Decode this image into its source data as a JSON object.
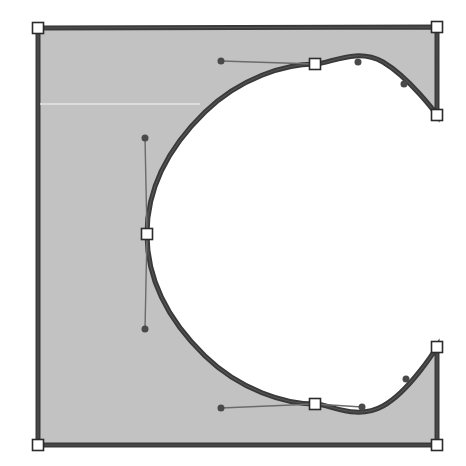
{
  "app": {
    "title": "Glyph Outline Editor",
    "view_name": "glyph-outline-view",
    "canvas_width": 466,
    "canvas_height": 466,
    "background_color": "#ffffff"
  },
  "glyph": {
    "character": "C",
    "name": "latin-capital-letter-c",
    "fill_color": "#c2c2c2",
    "outline_color": "#3a3a3a",
    "outline_width": 5,
    "inner_outline_color": "#55555a",
    "scanline_color": "#e4e4e4",
    "scanline_y": 104,
    "path": "M 38 28 L 437 27 L 437 115 C 437 115 410 78 383 62 C 356 47 330 64 315 64 C 285 64 240 78 205 112 C 170 146 147 185 147 234 C 147 283 170 322 205 356 C 240 390 285 404 315 404 C 330 404 356 421 383 406 C 410 391 437 347 437 347 L 437 445 L 38 445 Z"
  },
  "nodes": [
    {
      "id": "n1",
      "type": "corner",
      "label": "top-left-corner-node",
      "x": 38,
      "y": 28,
      "selected": true
    },
    {
      "id": "n2",
      "type": "corner",
      "label": "top-right-corner-node",
      "x": 437,
      "y": 27,
      "selected": true
    },
    {
      "id": "n3",
      "type": "corner",
      "label": "upper-terminal-node",
      "x": 437,
      "y": 115,
      "selected": true
    },
    {
      "id": "n4",
      "type": "curve",
      "label": "top-arc-node",
      "x": 315,
      "y": 64,
      "selected": true
    },
    {
      "id": "n5",
      "type": "curve",
      "label": "left-arc-node",
      "x": 147,
      "y": 234,
      "selected": true
    },
    {
      "id": "n6",
      "type": "curve",
      "label": "bottom-arc-node",
      "x": 315,
      "y": 404,
      "selected": true
    },
    {
      "id": "n7",
      "type": "corner",
      "label": "lower-terminal-node",
      "x": 437,
      "y": 347,
      "selected": true
    },
    {
      "id": "n8",
      "type": "corner",
      "label": "bottom-right-corner-node",
      "x": 437,
      "y": 445,
      "selected": true
    },
    {
      "id": "n9",
      "type": "corner",
      "label": "bottom-left-corner-node",
      "x": 38,
      "y": 445,
      "selected": true
    }
  ],
  "handles": [
    {
      "id": "h1",
      "label": "top-arc-handle-in",
      "anchor_x": 315,
      "anchor_y": 64,
      "x": 221,
      "y": 61,
      "visible_line": true
    },
    {
      "id": "h2",
      "label": "top-arc-handle-out",
      "anchor_x": 315,
      "anchor_y": 64,
      "x": 358,
      "y": 62,
      "visible_line": false
    },
    {
      "id": "h3",
      "label": "upper-terminal-handle",
      "anchor_x": 437,
      "anchor_y": 115,
      "x": 404,
      "y": 84,
      "visible_line": false
    },
    {
      "id": "h4",
      "label": "left-arc-handle-up",
      "anchor_x": 147,
      "anchor_y": 234,
      "x": 145,
      "y": 138,
      "visible_line": true
    },
    {
      "id": "h5",
      "label": "left-arc-handle-down",
      "anchor_x": 147,
      "anchor_y": 234,
      "x": 145,
      "y": 329,
      "visible_line": true
    },
    {
      "id": "h6",
      "label": "bottom-arc-handle-in",
      "anchor_x": 315,
      "anchor_y": 404,
      "x": 221,
      "y": 408,
      "visible_line": true
    },
    {
      "id": "h7",
      "label": "bottom-arc-handle-out",
      "anchor_x": 315,
      "anchor_y": 404,
      "x": 362,
      "y": 407,
      "visible_line": true
    },
    {
      "id": "h8",
      "label": "lower-terminal-handle",
      "anchor_x": 437,
      "anchor_y": 347,
      "x": 406,
      "y": 379,
      "visible_line": false
    }
  ],
  "node_style": {
    "corner_size": 11,
    "curve_size": 11,
    "node_fill": "#ffffff",
    "node_stroke": "#2b2b2b",
    "handle_dot_radius": 3.5,
    "handle_dot_color": "#4a4a4a",
    "handle_line_color": "#6b6b6b",
    "handle_line_width": 1.4
  }
}
